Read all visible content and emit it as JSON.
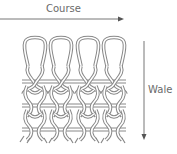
{
  "diagram": {
    "labels": {
      "course": "Course",
      "wale": "Wale"
    },
    "loops": {
      "columns": 4,
      "rows": 3
    },
    "colors": {
      "stroke": "#7a7a7a",
      "text": "#6a6a6a",
      "background": "#ffffff"
    }
  }
}
